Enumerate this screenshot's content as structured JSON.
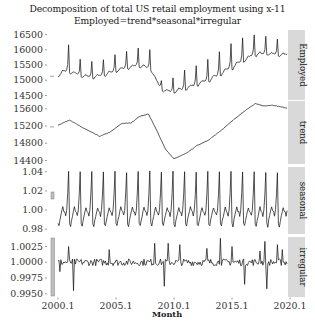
{
  "chart_data": {
    "type": "line",
    "title": "Decomposition of total US retail employment using x-11",
    "subtitle": "Employed=trend*seasonal*irregular",
    "xlabel": "Month",
    "ylabel": "",
    "x_ticks": [
      "2000.1",
      "2005.1",
      "2010.1",
      "2015.1",
      "2020.1"
    ],
    "x_range": [
      2000.0,
      2019.75
    ],
    "grid": false,
    "legend": "none",
    "facet_strips": [
      "Employed",
      "trend",
      "seasonal",
      "irregular"
    ],
    "panels": [
      {
        "name": "Employed",
        "y_ticks": [
          "14500",
          "15000",
          "15500",
          "16000",
          "16500"
        ],
        "ylim": [
          14350,
          16650
        ],
        "range_bar_height_frac": 0.0,
        "description": "Monthly retail employment (thousands); annual December peaks; falls sharply 2008-2010 then recovers, peaking near 16400 around 2017-2019",
        "yearly_base": [
          15100,
          15220,
          15080,
          15040,
          15120,
          15250,
          15350,
          15420,
          15300,
          14620,
          14560,
          14660,
          14780,
          14920,
          15120,
          15330,
          15580,
          15780,
          15820,
          15780
        ],
        "yearly_peak": [
          16050,
          15820,
          15660,
          15610,
          15720,
          15850,
          15980,
          16100,
          15620,
          15120,
          15240,
          15380,
          15560,
          15740,
          16020,
          16160,
          16300,
          16420,
          16380,
          16340
        ]
      },
      {
        "name": "trend",
        "y_ticks": [
          "14400",
          "14800",
          "15200",
          "15600"
        ],
        "ylim": [
          14320,
          15780
        ],
        "description": "Smooth trend: rises to ~15350 in 2001, declines to ~14950 by 2003.5, climbs to ~15500 by 2007.5, drops to ~14430 in early 2010, recovers steadily to ~15720 by 2017, eases to ~15650 by 2019",
        "x": [
          2000.0,
          2001.0,
          2002.0,
          2003.0,
          2003.6,
          2004.5,
          2005.5,
          2006.3,
          2007.0,
          2007.8,
          2008.5,
          2009.3,
          2010.0,
          2011.0,
          2012.0,
          2013.0,
          2014.0,
          2015.0,
          2016.0,
          2017.0,
          2017.8,
          2018.5,
          2019.7
        ],
        "values": [
          15220,
          15340,
          15180,
          15040,
          14960,
          15060,
          15260,
          15270,
          15420,
          15480,
          15100,
          14650,
          14440,
          14560,
          14750,
          14880,
          15080,
          15320,
          15530,
          15720,
          15660,
          15680,
          15620
        ]
      },
      {
        "name": "seasonal",
        "y_ticks": [
          "0.98",
          "1.00",
          "1.02",
          "1.04"
        ],
        "ylim": [
          0.975,
          1.045
        ],
        "description": "Strong annual pattern: Dec peak ~1.04, Jan-Feb trough ~0.983, mid-year ~1.0",
        "monthly_factors": [
          0.986,
          0.983,
          0.989,
          0.994,
          0.999,
          1.003,
          0.999,
          0.998,
          0.994,
          1.0,
          1.017,
          1.04
        ]
      },
      {
        "name": "irregular",
        "y_ticks": [
          "0.9950",
          "1.0000",
          "1.0025"
        ],
        "ytick_labels_all": [
          "0.9950",
          "0.9975",
          "1.0000",
          "1.0025"
        ],
        "ylim": [
          0.9945,
          1.004
        ],
        "description": "Noise around 1.0 with occasional spikes up to ~1.0035 and dips to ~0.9955",
        "notable_spikes": [
          {
            "x": 2000.2,
            "value": 0.9985
          },
          {
            "x": 2000.9,
            "value": 1.0025
          },
          {
            "x": 2001.3,
            "value": 0.9955
          },
          {
            "x": 2004.4,
            "value": 1.002
          },
          {
            "x": 2008.3,
            "value": 1.003
          },
          {
            "x": 2009.2,
            "value": 0.9962
          },
          {
            "x": 2009.5,
            "value": 1.003
          },
          {
            "x": 2010.5,
            "value": 1.0028
          },
          {
            "x": 2012.8,
            "value": 1.0022
          },
          {
            "x": 2014.0,
            "value": 1.0038
          },
          {
            "x": 2015.0,
            "value": 1.0025
          },
          {
            "x": 2016.1,
            "value": 0.9965
          },
          {
            "x": 2017.4,
            "value": 1.0018
          },
          {
            "x": 2017.8,
            "value": 1.0033
          },
          {
            "x": 2018.0,
            "value": 0.9958
          },
          {
            "x": 2018.9,
            "value": 1.0028
          },
          {
            "x": 2019.3,
            "value": 1.002
          }
        ]
      }
    ]
  },
  "labels": {
    "title": "Decomposition of total US retail employment using x-11",
    "subtitle": "Employed=trend*seasonal*irregular",
    "xlabel": "Month"
  },
  "colors": {
    "line": "#1a1a1a",
    "strip_bg": "#d9d9d9",
    "panel_bg": "#ffffff",
    "range_bar_fill": "#bfbfbf",
    "range_bar_stroke": "#7f7f7f"
  }
}
